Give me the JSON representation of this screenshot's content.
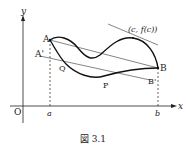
{
  "figure": {
    "caption": "図 3.1",
    "axes": {
      "x_label": "x",
      "y_label": "y",
      "origin_label": "O",
      "x_ticks": [
        "a",
        "b"
      ]
    },
    "points": {
      "A": "A",
      "B": "B",
      "A_prime": "A'",
      "B_prime": "B'",
      "P": "P",
      "Q": "Q",
      "tangent_point": "(c, f(c))"
    },
    "colors": {
      "ink": "#222222",
      "background": "#ffffff"
    }
  }
}
